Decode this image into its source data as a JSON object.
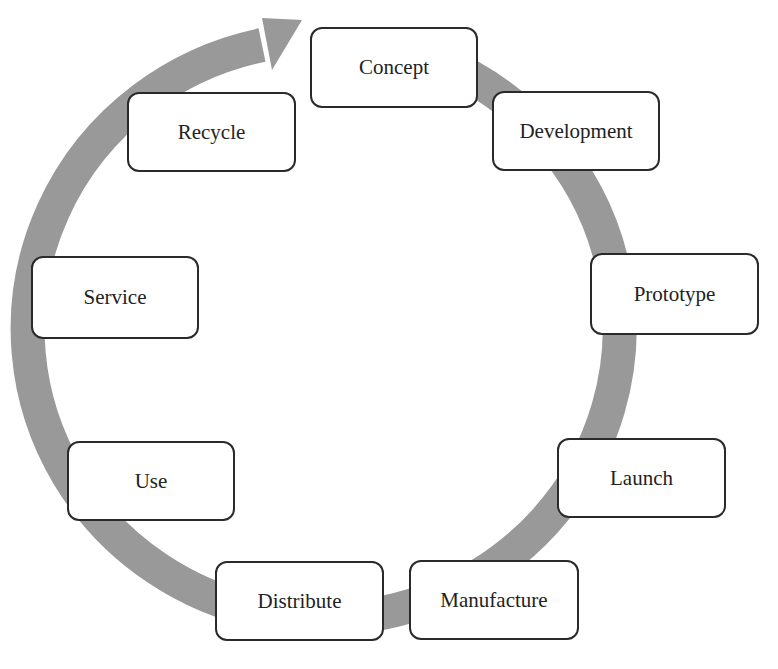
{
  "diagram": {
    "type": "cycle",
    "title": "",
    "ring_color": "#999999",
    "box_border_color": "#2a2a2a",
    "direction": "clockwise",
    "nodes": [
      {
        "label": "Concept",
        "x": 310,
        "y": 27,
        "w": 168,
        "h": 81
      },
      {
        "label": "Development",
        "x": 492,
        "y": 91,
        "w": 168,
        "h": 80
      },
      {
        "label": "Prototype",
        "x": 590,
        "y": 253,
        "w": 169,
        "h": 82
      },
      {
        "label": "Launch",
        "x": 557,
        "y": 438,
        "w": 169,
        "h": 80
      },
      {
        "label": "Manufacture",
        "x": 409,
        "y": 560,
        "w": 170,
        "h": 80
      },
      {
        "label": "Distribute",
        "x": 215,
        "y": 561,
        "w": 169,
        "h": 80
      },
      {
        "label": "Use",
        "x": 67,
        "y": 441,
        "w": 168,
        "h": 80
      },
      {
        "label": "Service",
        "x": 31,
        "y": 256,
        "w": 168,
        "h": 83
      },
      {
        "label": "Recycle",
        "x": 127,
        "y": 92,
        "w": 169,
        "h": 80
      }
    ],
    "edges": [
      [
        "Concept",
        "Development"
      ],
      [
        "Development",
        "Prototype"
      ],
      [
        "Prototype",
        "Launch"
      ],
      [
        "Launch",
        "Manufacture"
      ],
      [
        "Manufacture",
        "Distribute"
      ],
      [
        "Distribute",
        "Use"
      ],
      [
        "Use",
        "Service"
      ],
      [
        "Service",
        "Recycle"
      ],
      [
        "Recycle",
        "Concept"
      ]
    ]
  }
}
